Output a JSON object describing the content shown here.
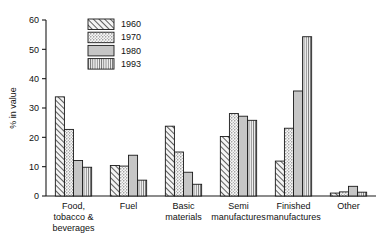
{
  "chart_data": {
    "type": "bar",
    "title": "",
    "subtitle": "",
    "xlabel": "",
    "ylabel": "% in value",
    "ylim": [
      0,
      60
    ],
    "yticks": [
      0,
      10,
      20,
      30,
      40,
      50,
      60
    ],
    "grid": false,
    "legend_position": "top-left-inside",
    "categories": [
      "Food,\ntobacco &\nbeverages",
      "Fuel",
      "Basic\nmaterials",
      "Semi\nmanufactures",
      "Finished\nmanufactures",
      "Other"
    ],
    "category_lines": [
      [
        "Food,",
        "tobacco &",
        "beverages"
      ],
      [
        "Fuel"
      ],
      [
        "Basic",
        "materials"
      ],
      [
        "Semi",
        "manufactures"
      ],
      [
        "Finished",
        "manufactures"
      ],
      [
        "Other"
      ]
    ],
    "series": [
      {
        "name": "1960",
        "pattern": "diagonal-hatch",
        "values": [
          33.8,
          10.4,
          23.8,
          20.3,
          11.9,
          1.0
        ]
      },
      {
        "name": "1970",
        "pattern": "dotted-stipple",
        "values": [
          22.7,
          10.2,
          15.0,
          28.1,
          23.1,
          1.4
        ]
      },
      {
        "name": "1980",
        "pattern": "solid-gray",
        "values": [
          12.1,
          13.9,
          8.1,
          27.2,
          35.8,
          3.3
        ]
      },
      {
        "name": "1993",
        "pattern": "vertical-lines",
        "values": [
          9.8,
          5.4,
          4.0,
          25.8,
          54.3,
          1.3
        ]
      }
    ]
  },
  "legend": {
    "entries": [
      {
        "label": "1960"
      },
      {
        "label": "1970"
      },
      {
        "label": "1980"
      },
      {
        "label": "1993"
      }
    ]
  },
  "axis": {
    "y_label": "% in value",
    "y_tick_labels": [
      "0",
      "10",
      "20",
      "30",
      "40",
      "50",
      "60"
    ]
  },
  "colors": {
    "stroke": "#1a1a1a",
    "fill_light": "#f2f2f2",
    "fill_gray": "#c8c8c8",
    "background": "#ffffff"
  }
}
